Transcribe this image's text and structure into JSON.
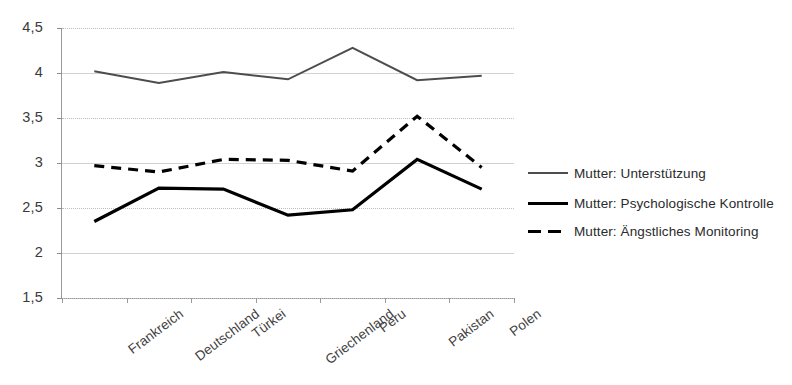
{
  "chart_data": {
    "type": "line",
    "title": "",
    "xlabel": "",
    "ylabel": "",
    "categories": [
      "Frankreich",
      "Deutschland",
      "Türkei",
      "Griechenland",
      "Peru",
      "Pakistan",
      "Polen"
    ],
    "ylim": [
      1.5,
      4.5
    ],
    "yticks": [
      "4,5",
      "4",
      "3,5",
      "3",
      "2,5",
      "2",
      "1,5"
    ],
    "ytick_values": [
      4.5,
      4,
      3.5,
      3,
      2.5,
      2,
      1.5
    ],
    "grid": true,
    "legend_position": "right",
    "series": [
      {
        "name": "Mutter: Unterstützung",
        "values": [
          4.02,
          3.89,
          4.01,
          3.93,
          4.28,
          3.92,
          3.97
        ],
        "color": "#4d4d4d",
        "width": 2.0,
        "dash": "none"
      },
      {
        "name": "Mutter: Psychologische Kontrolle",
        "values": [
          2.35,
          2.72,
          2.71,
          2.42,
          2.48,
          3.04,
          2.71
        ],
        "color": "#000000",
        "width": 3.2,
        "dash": "none"
      },
      {
        "name": "Mutter: Ängstliches Monitoring",
        "values": [
          2.97,
          2.9,
          3.04,
          3.03,
          2.91,
          3.52,
          2.95
        ],
        "color": "#000000",
        "width": 3.2,
        "dash": "10,7"
      }
    ]
  },
  "legend": {
    "items": [
      {
        "label": "Mutter: Unterstützung"
      },
      {
        "label": "Mutter: Psychologische Kontrolle"
      },
      {
        "label": "Mutter: Ängstliches Monitoring"
      }
    ]
  }
}
